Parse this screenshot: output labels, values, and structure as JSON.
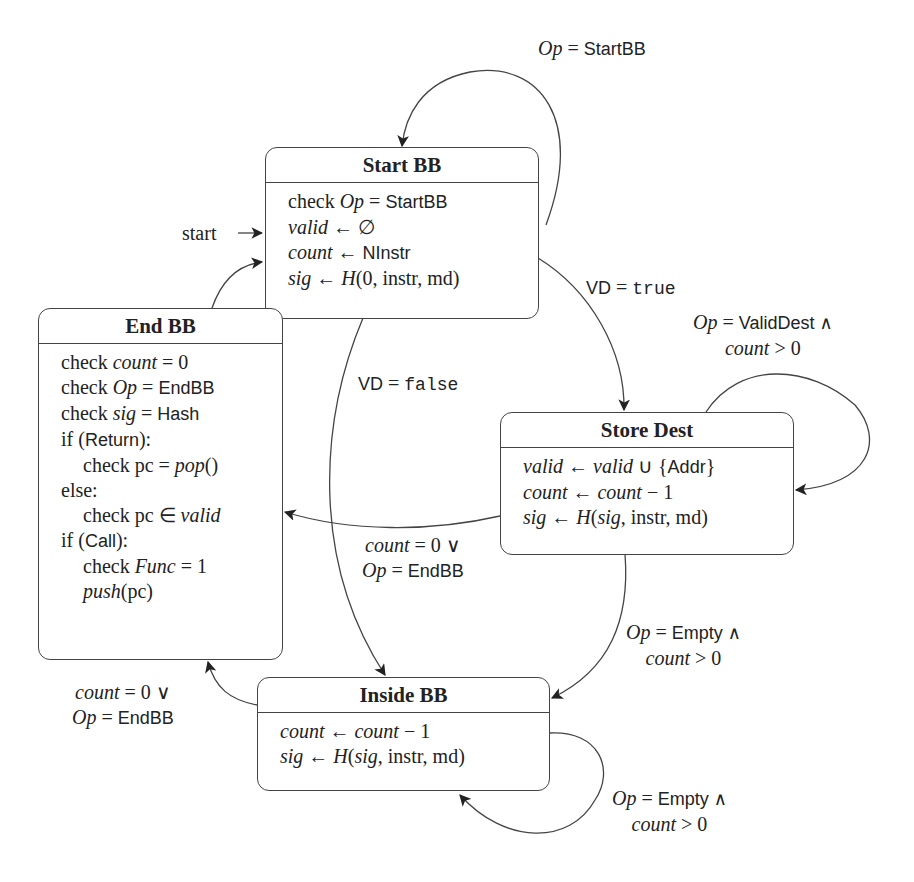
{
  "diagram": {
    "type": "state-machine",
    "start_label": "start",
    "states": [
      {
        "id": "start_bb",
        "title": "Start BB",
        "lines": [
          {
            "a": "check ",
            "b": "Op",
            "c": " = ",
            "d": "StartBB"
          },
          {
            "a": "",
            "b": "valid",
            "c": " ← ",
            "d": "∅"
          },
          {
            "a": "",
            "b": "count",
            "c": " ← ",
            "d": "NInstr"
          },
          {
            "a": "",
            "b": "sig",
            "c": " ← ",
            "d": "H(0, instr, md)"
          }
        ]
      },
      {
        "id": "end_bb",
        "title": "End BB",
        "lines": [
          {
            "text": "check count = 0"
          },
          {
            "text": "check Op = EndBB"
          },
          {
            "text": "check sig = Hash"
          },
          {
            "text": "if (Return):"
          },
          {
            "text": "check pc = pop()",
            "indent": true
          },
          {
            "text": "else:"
          },
          {
            "text": "check pc ∈ valid",
            "indent": true
          },
          {
            "text": "if (Call):"
          },
          {
            "text": "check Func = 1",
            "indent": true
          },
          {
            "text": "push(pc)",
            "indent": true
          }
        ]
      },
      {
        "id": "store_dest",
        "title": "Store Dest",
        "lines": [
          {
            "text": "valid ← valid ∪ {Addr}"
          },
          {
            "text": "count ← count − 1"
          },
          {
            "text": "sig ← H(sig, instr, md)"
          }
        ]
      },
      {
        "id": "inside_bb",
        "title": "Inside BB",
        "lines": [
          {
            "text": "count ← count − 1"
          },
          {
            "text": "sig ← H(sig, instr, md)"
          }
        ]
      }
    ],
    "transitions": [
      {
        "from": "start_bb",
        "to": "start_bb",
        "label": [
          "Op = StartBB"
        ]
      },
      {
        "from": "start_bb",
        "to": "store_dest",
        "label": [
          "VD = true"
        ]
      },
      {
        "from": "start_bb",
        "to": "inside_bb",
        "label": [
          "VD = false"
        ]
      },
      {
        "from": "store_dest",
        "to": "store_dest",
        "label": [
          "Op = ValidDest ∧",
          "count > 0"
        ]
      },
      {
        "from": "store_dest",
        "to": "end_bb",
        "label": [
          "count = 0 ∨",
          "Op = EndBB"
        ]
      },
      {
        "from": "store_dest",
        "to": "inside_bb",
        "label": [
          "Op = Empty ∧",
          "count > 0"
        ]
      },
      {
        "from": "inside_bb",
        "to": "end_bb",
        "label": [
          "count = 0 ∨",
          "Op = EndBB"
        ]
      },
      {
        "from": "inside_bb",
        "to": "inside_bb",
        "label": [
          "Op = Empty ∧",
          "count > 0"
        ]
      },
      {
        "from": "end_bb",
        "to": "start_bb",
        "label": []
      }
    ]
  },
  "labels": {
    "start": "start",
    "self_start": {
      "lhs": "Op",
      "eq": " = ",
      "rhs": "StartBB"
    },
    "vd_true": {
      "lhs": "VD",
      "eq": " = ",
      "rhs": "true"
    },
    "vd_false": {
      "lhs": "VD",
      "eq": " = ",
      "rhs": "false"
    },
    "self_store": {
      "l1_lhs": "Op",
      "l1_eq": " = ",
      "l1_rhs": "ValidDest ∧",
      "l2_lhs": "count",
      "l2_rhs": " > 0"
    },
    "store_to_end": {
      "l1_lhs": "count",
      "l1_rhs": " = 0 ∨",
      "l2_lhs": "Op",
      "l2_eq": " = ",
      "l2_rhs": "EndBB"
    },
    "store_to_inside": {
      "l1_lhs": "Op",
      "l1_eq": " = ",
      "l1_rhs": "Empty ∧",
      "l2_lhs": "count",
      "l2_rhs": " > 0"
    },
    "inside_to_end": {
      "l1_lhs": "count",
      "l1_rhs": " = 0 ∨",
      "l2_lhs": "Op",
      "l2_eq": " = ",
      "l2_rhs": "EndBB"
    },
    "self_inside": {
      "l1_lhs": "Op",
      "l1_eq": " = ",
      "l1_rhs": "Empty ∧",
      "l2_lhs": "count",
      "l2_rhs": " > 0"
    }
  },
  "boxes": {
    "start_bb": {
      "title": "Start BB",
      "l1": {
        "a": "check ",
        "b": "Op",
        "c": " = ",
        "d": "StartBB"
      },
      "l2": {
        "b": "valid",
        "c": " ← ",
        "d": "∅"
      },
      "l3": {
        "b": "count",
        "c": " ← ",
        "d": "NInstr"
      },
      "l4": {
        "b": "sig",
        "c": " ← ",
        "d1": "H",
        "d2": "(0, instr, md)"
      }
    },
    "end_bb": {
      "title": "End BB",
      "l1": {
        "a": "check ",
        "b": "count",
        "c": " = 0"
      },
      "l2": {
        "a": "check ",
        "b": "Op",
        "c": " = ",
        "d": "EndBB"
      },
      "l3": {
        "a": "check ",
        "b": "sig",
        "c": " = ",
        "d": "Hash"
      },
      "l4": {
        "a": "if (",
        "d": "Return",
        "c": "):"
      },
      "l5": {
        "a": "check pc = ",
        "b": "pop",
        "c": "()"
      },
      "l6": {
        "a": "else:"
      },
      "l7": {
        "a": "check pc ∈ ",
        "b": "valid"
      },
      "l8": {
        "a": "if (",
        "d": "Call",
        "c": "):"
      },
      "l9": {
        "a": "check ",
        "b": "Func",
        "c": " = 1"
      },
      "l10": {
        "b": "push",
        "c": "(pc)"
      }
    },
    "store_dest": {
      "title": "Store Dest",
      "l1": {
        "b": "valid",
        "c": " ← ",
        "b2": "valid",
        "c2": " ∪ {",
        "d": "Addr",
        "e": "}"
      },
      "l2": {
        "b": "count",
        "c": " ← ",
        "b2": "count",
        "c2": " − 1"
      },
      "l3": {
        "b": "sig",
        "c": " ← ",
        "d1": "H",
        "c2": "(",
        "b2": "sig",
        "e": ", instr, md)"
      }
    },
    "inside_bb": {
      "title": "Inside BB",
      "l1": {
        "b": "count",
        "c": " ← ",
        "b2": "count",
        "c2": " − 1"
      },
      "l2": {
        "b": "sig",
        "c": " ← ",
        "d1": "H",
        "c2": "(",
        "b2": "sig",
        "e": ", instr, md)"
      }
    }
  },
  "colors": {
    "stroke": "#444444",
    "text": "#222222",
    "background": "#ffffff"
  }
}
